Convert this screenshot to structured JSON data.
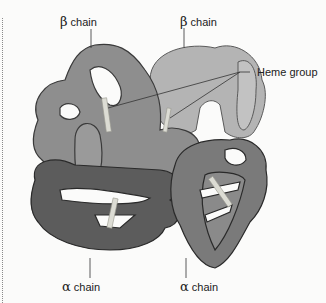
{
  "diagram": {
    "labels": {
      "beta_chain_left": {
        "greek": "β",
        "text": "chain"
      },
      "beta_chain_right": {
        "greek": "β",
        "text": "chain"
      },
      "heme_group": "Heme group",
      "alpha_chain_left": {
        "greek": "α",
        "text": "chain"
      },
      "alpha_chain_right": {
        "greek": "α",
        "text": "chain"
      }
    },
    "colors": {
      "beta_left": "#8e8e8e",
      "beta_right": "#b4b4b4",
      "alpha_left": "#5c5c5c",
      "alpha_right": "#7a7a7a",
      "outline": "#3a3a3a",
      "heme": "#d8d8d0",
      "background": "#fbfbfa"
    }
  }
}
